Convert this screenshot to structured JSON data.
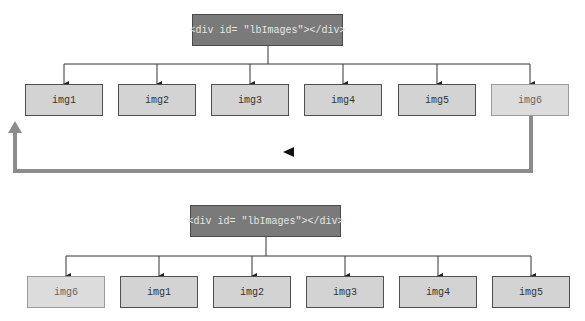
{
  "diagram_top": {
    "parent_label": "<div id= \"lbImages\"></div>",
    "children": [
      "img1",
      "img2",
      "img3",
      "img4",
      "img5",
      "img6"
    ],
    "moved_child": "img6"
  },
  "diagram_bottom": {
    "parent_label": "<div id= \"lbImages\"></div>",
    "children": [
      "img6",
      "img1",
      "img2",
      "img3",
      "img4",
      "img5"
    ],
    "moved_child": "img6"
  },
  "colors": {
    "parent_fill": "#7a7a7a",
    "child_fill": "#d3d3d3",
    "moved_child_fill": "#dcdcdc",
    "move_arrow": "#8c8c8c",
    "connector": "#333333"
  },
  "icons": {
    "direction_indicator": "left-triangle-icon",
    "move_arrow": "up-arrow-icon"
  }
}
